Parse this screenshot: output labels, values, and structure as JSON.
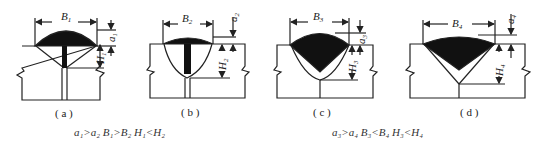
{
  "figure": {
    "panels": [
      {
        "id": "a",
        "caption": "( a )",
        "width_label": "B",
        "width_sub": "1",
        "reinforcement_label": "a",
        "reinforcement_sub": "1",
        "depth_label": "H",
        "depth_sub": "1"
      },
      {
        "id": "b",
        "caption": "( b )",
        "width_label": "B",
        "width_sub": "2",
        "reinforcement_label": "a",
        "reinforcement_sub": "2",
        "depth_label": "H",
        "depth_sub": "2"
      },
      {
        "id": "c",
        "caption": "( c )",
        "width_label": "B",
        "width_sub": "3",
        "reinforcement_label": "a",
        "reinforcement_sub": "3",
        "depth_label": "H",
        "depth_sub": "3"
      },
      {
        "id": "d",
        "caption": "( d )",
        "width_label": "B",
        "width_sub": "4",
        "reinforcement_label": "a",
        "reinforcement_sub": "4",
        "depth_label": "H",
        "depth_sub": "4"
      }
    ],
    "relations": [
      {
        "text": "a₁>a₂   B₁>B₂   H₁<H₂"
      },
      {
        "text": "a₃>a₄   B₃<B₄   H₃<H₄"
      }
    ],
    "colors": {
      "line": "#222222",
      "fill": "#111111",
      "background": "#ffffff"
    }
  }
}
